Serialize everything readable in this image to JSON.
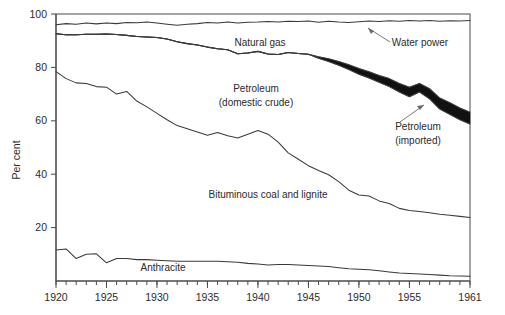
{
  "chart_data": {
    "type": "area",
    "title": "",
    "subtitle": "",
    "xlabel": "",
    "ylabel": "Per cent",
    "xlim": [
      1920,
      1961
    ],
    "ylim": [
      0,
      100
    ],
    "grid": false,
    "legend_position": "inline-annotations",
    "x_tick_labels": [
      "1920",
      "1925",
      "1930",
      "1935",
      "1940",
      "1945",
      "1950",
      "1955",
      "1961"
    ],
    "x_tick_values": [
      1920,
      1925,
      1930,
      1935,
      1940,
      1945,
      1950,
      1955,
      1961
    ],
    "x_minor_tick_interval": 1,
    "y_tick_labels": [
      "100",
      "80",
      "60",
      "40",
      "20"
    ],
    "y_tick_values": [
      100,
      80,
      60,
      40,
      20
    ],
    "annotations": [
      {
        "name": "natural-gas",
        "text": "Natural gas",
        "x": 1949,
        "y": 96.5
      },
      {
        "name": "water-power",
        "text": "Water power",
        "x": 1953.5,
        "y": 95.0
      },
      {
        "name": "petroleum-domestic-crude",
        "text": "Petroleum",
        "text2": "(domestic crude)",
        "x": 1945,
        "y": 88.5
      },
      {
        "name": "petroleum-imported",
        "text": "Petroleum",
        "text2": "(imported)",
        "x": 1956,
        "y": 76.5
      },
      {
        "name": "bituminous-coal-and-lignite",
        "text": "Bituminous coal and lignite",
        "x": 1943,
        "y": 43.0
      },
      {
        "name": "anthracite",
        "text": "Anthracite",
        "x": 1931,
        "y": 5.5
      }
    ],
    "x": [
      1920,
      1921,
      1922,
      1923,
      1924,
      1925,
      1926,
      1927,
      1928,
      1929,
      1930,
      1931,
      1932,
      1933,
      1934,
      1935,
      1936,
      1937,
      1938,
      1939,
      1940,
      1941,
      1942,
      1943,
      1944,
      1945,
      1946,
      1947,
      1948,
      1949,
      1950,
      1951,
      1952,
      1953,
      1954,
      1955,
      1956,
      1957,
      1958,
      1959,
      1960,
      1961
    ],
    "series": [
      {
        "name": "Water power (cumulative top)",
        "note": "upper boundary of water power band; total reaches 100",
        "values": [
          100,
          100,
          100,
          100,
          100,
          100,
          100,
          100,
          100,
          100,
          100,
          100,
          100,
          100,
          100,
          100,
          100,
          100,
          100,
          100,
          100,
          100,
          100,
          100,
          100,
          100,
          100,
          100,
          100,
          100,
          100,
          100,
          100,
          100,
          100,
          100,
          100,
          100,
          100,
          100,
          100,
          100
        ]
      },
      {
        "name": "Natural gas (cumulative top)",
        "note": "boundary between natural gas and water power",
        "values": [
          96.0,
          96.4,
          96.2,
          96.6,
          96.3,
          96.6,
          96.4,
          96.8,
          96.7,
          97.0,
          96.6,
          96.2,
          95.8,
          96.2,
          96.4,
          96.8,
          96.6,
          97.0,
          96.6,
          96.9,
          97.0,
          97.2,
          97.0,
          97.3,
          97.2,
          97.4,
          96.9,
          97.3,
          97.0,
          96.8,
          97.1,
          97.4,
          97.2,
          97.5,
          97.3,
          97.6,
          97.4,
          97.6,
          97.3,
          97.5,
          97.4,
          97.6
        ]
      },
      {
        "name": "Petroleum imported (cumulative top)",
        "note": "boundary between imported petroleum and natural gas; identical to domestic-crude top until ~1946",
        "values": [
          92.6,
          92.2,
          92.2,
          92.4,
          92.4,
          92.5,
          92.3,
          92.0,
          91.6,
          91.4,
          91.2,
          90.6,
          89.6,
          88.9,
          88.4,
          87.6,
          87.0,
          86.6,
          85.1,
          85.4,
          86.0,
          85.0,
          84.8,
          85.6,
          85.2,
          84.9,
          84.0,
          83.2,
          82.2,
          81.0,
          79.6,
          78.4,
          77.0,
          75.8,
          74.0,
          72.6,
          74.0,
          72.0,
          68.5,
          66.8,
          64.8,
          63.2
        ]
      },
      {
        "name": "Petroleum domestic crude (cumulative top)",
        "note": "boundary between domestic crude and imported petroleum band",
        "values": [
          92.6,
          92.2,
          92.2,
          92.4,
          92.4,
          92.5,
          92.3,
          92.0,
          91.6,
          91.4,
          91.2,
          90.6,
          89.6,
          88.9,
          88.4,
          87.6,
          87.0,
          86.6,
          85.1,
          85.4,
          86.0,
          85.0,
          84.8,
          85.6,
          85.2,
          84.9,
          83.4,
          82.2,
          80.8,
          79.2,
          77.4,
          76.0,
          74.4,
          72.8,
          70.8,
          69.0,
          70.8,
          68.2,
          64.4,
          62.4,
          60.4,
          58.8
        ]
      },
      {
        "name": "Bituminous coal and lignite (cumulative top)",
        "note": "boundary between bituminous coal and petroleum",
        "values": [
          78.4,
          75.8,
          74.2,
          74.0,
          72.8,
          72.6,
          70.0,
          71.0,
          67.4,
          65.2,
          62.8,
          60.4,
          58.2,
          57.0,
          55.8,
          54.6,
          55.6,
          54.4,
          53.6,
          55.0,
          56.4,
          55.0,
          52.0,
          48.0,
          45.6,
          43.2,
          41.4,
          39.8,
          37.2,
          34.0,
          32.2,
          31.8,
          30.0,
          29.0,
          27.2,
          26.4,
          26.0,
          25.6,
          25.0,
          24.6,
          24.2,
          23.8
        ]
      },
      {
        "name": "Anthracite (cumulative top)",
        "note": "bottom band; boundary between anthracite and bituminous coal",
        "values": [
          11.6,
          12.0,
          8.4,
          10.0,
          10.2,
          6.8,
          8.4,
          8.4,
          8.0,
          8.0,
          7.8,
          7.6,
          7.4,
          7.4,
          7.4,
          7.4,
          7.4,
          7.2,
          7.0,
          6.6,
          6.4,
          6.0,
          6.2,
          6.2,
          6.0,
          5.8,
          5.6,
          5.4,
          5.0,
          4.6,
          4.4,
          4.2,
          3.8,
          3.4,
          3.0,
          2.8,
          2.6,
          2.4,
          2.2,
          2.0,
          1.9,
          1.8
        ]
      }
    ]
  },
  "axes": {
    "y_axis_title": "Per cent"
  }
}
